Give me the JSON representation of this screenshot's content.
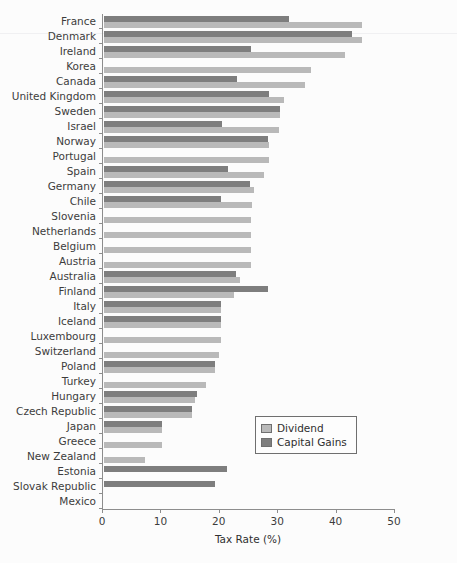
{
  "chart_data": {
    "type": "bar",
    "orientation": "horizontal",
    "title": "",
    "xlabel": "Tax Rate (%)",
    "ylabel": "",
    "xlim": [
      0,
      50
    ],
    "xticks": [
      0,
      10,
      20,
      30,
      40,
      50
    ],
    "grid": false,
    "legend_position": "center-right",
    "categories": [
      "France",
      "Denmark",
      "Ireland",
      "Korea",
      "Canada",
      "United Kingdom",
      "Sweden",
      "Israel",
      "Norway",
      "Portugal",
      "Spain",
      "Germany",
      "Chile",
      "Slovenia",
      "Netherlands",
      "Belgium",
      "Austria",
      "Australia",
      "Finland",
      "Italy",
      "Iceland",
      "Luxembourg",
      "Switzerland",
      "Poland",
      "Turkey",
      "Hungary",
      "Czech Republic",
      "Japan",
      "Greece",
      "New Zealand",
      "Estonia",
      "Slovak Republic",
      "Mexico"
    ],
    "series": [
      {
        "name": "Dividend",
        "color": "#b9b9b9",
        "values": [
          44.2,
          44.2,
          41.3,
          35.4,
          34.4,
          30.8,
          30.2,
          30.0,
          28.2,
          28.2,
          27.4,
          25.7,
          25.3,
          25.2,
          25.2,
          25.2,
          25.2,
          23.3,
          22.3,
          20.1,
          20.0,
          20.0,
          19.7,
          19.0,
          17.5,
          15.6,
          15.0,
          10.0,
          10.0,
          7.0,
          0.0,
          0.0,
          0.0
        ]
      },
      {
        "name": "Capital Gains",
        "color": "#7e7e7e",
        "values": [
          31.7,
          42.5,
          25.2,
          0.0,
          22.8,
          28.2,
          30.1,
          20.2,
          28.1,
          0.0,
          21.2,
          25.0,
          20.1,
          0.0,
          0.0,
          0.0,
          0.0,
          22.6,
          28.1,
          20.1,
          20.0,
          0.0,
          0.0,
          19.0,
          0.0,
          15.9,
          15.0,
          10.0,
          0.0,
          0.0,
          21.0,
          19.0,
          0.0
        ]
      }
    ]
  },
  "legend": {
    "items": [
      {
        "label": "Dividend",
        "swatch": "dividend"
      },
      {
        "label": "Capital Gains",
        "swatch": "capital"
      }
    ]
  },
  "axis": {
    "x_title": "Tax Rate (%)",
    "x_tick_labels": [
      "0",
      "10",
      "20",
      "30",
      "40",
      "50"
    ]
  },
  "header": {
    "cropped_title": ""
  }
}
